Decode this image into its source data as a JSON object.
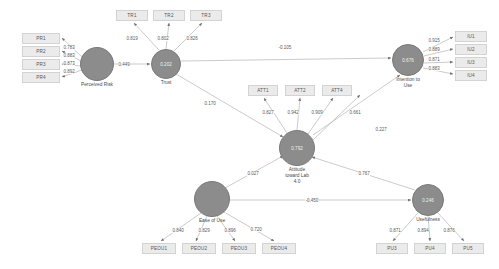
{
  "diagram": {
    "node_fill": "#8c8c8c",
    "indicator_fill": "#ebebeb",
    "edge_color": "#b0b0b0"
  },
  "constructs": [
    {
      "id": "pr",
      "label": "Perceived Risk",
      "value": "",
      "cx": 97,
      "cy": 64,
      "r": 17
    },
    {
      "id": "tr",
      "label": "Trust",
      "value": "0.202",
      "cx": 166,
      "cy": 64,
      "r": 15
    },
    {
      "id": "att",
      "label": "Attitude\ntoward Lab\n4.0",
      "value": "0.792",
      "cx": 297,
      "cy": 148,
      "r": 18
    },
    {
      "id": "iu",
      "label": "Intention to\nUse",
      "value": "0.676",
      "cx": 408,
      "cy": 60,
      "r": 16
    },
    {
      "id": "eou",
      "label": "Ease of Use",
      "value": "",
      "cx": 212,
      "cy": 199,
      "r": 18
    },
    {
      "id": "pu",
      "label": "Usefulness",
      "value": "0.246",
      "cx": 428,
      "cy": 200,
      "r": 16
    }
  ],
  "indicators": [
    {
      "id": "PR1",
      "label": "PR1",
      "x": 22,
      "y": 33,
      "w": 38,
      "h": 11
    },
    {
      "id": "PR2",
      "label": "PR2",
      "x": 22,
      "y": 46,
      "w": 38,
      "h": 11
    },
    {
      "id": "PR3",
      "label": "PR3",
      "x": 22,
      "y": 59,
      "w": 38,
      "h": 11
    },
    {
      "id": "PR4",
      "label": "PR4",
      "x": 22,
      "y": 72,
      "w": 38,
      "h": 11
    },
    {
      "id": "TR1",
      "label": "TR1",
      "x": 116,
      "y": 10,
      "w": 32,
      "h": 11
    },
    {
      "id": "TR2",
      "label": "TR2",
      "x": 153,
      "y": 10,
      "w": 32,
      "h": 11
    },
    {
      "id": "TR3",
      "label": "TR3",
      "x": 190,
      "y": 10,
      "w": 32,
      "h": 11
    },
    {
      "id": "ATT1",
      "label": "ATT1",
      "x": 248,
      "y": 85,
      "w": 30,
      "h": 11
    },
    {
      "id": "ATT2",
      "label": "ATT2",
      "x": 285,
      "y": 85,
      "w": 30,
      "h": 11
    },
    {
      "id": "ATT4",
      "label": "ATT4",
      "x": 322,
      "y": 85,
      "w": 30,
      "h": 11
    },
    {
      "id": "IU1",
      "label": "IU1",
      "x": 455,
      "y": 31,
      "w": 32,
      "h": 11
    },
    {
      "id": "IU2",
      "label": "IU2",
      "x": 455,
      "y": 44,
      "w": 32,
      "h": 11
    },
    {
      "id": "IU3",
      "label": "IU3",
      "x": 455,
      "y": 57,
      "w": 32,
      "h": 11
    },
    {
      "id": "IU4",
      "label": "IU4",
      "x": 455,
      "y": 70,
      "w": 32,
      "h": 11
    },
    {
      "id": "PEOU1",
      "label": "PEOU1",
      "x": 142,
      "y": 243,
      "w": 34,
      "h": 11
    },
    {
      "id": "PEOU2",
      "label": "PEOU2",
      "x": 182,
      "y": 243,
      "w": 34,
      "h": 11
    },
    {
      "id": "PEOU3",
      "label": "PEOU3",
      "x": 222,
      "y": 243,
      "w": 34,
      "h": 11
    },
    {
      "id": "PEOU4",
      "label": "PEOU4",
      "x": 262,
      "y": 243,
      "w": 34,
      "h": 11
    },
    {
      "id": "PU3",
      "label": "PU3",
      "x": 376,
      "y": 243,
      "w": 32,
      "h": 11
    },
    {
      "id": "PU4",
      "label": "PU4",
      "x": 414,
      "y": 243,
      "w": 32,
      "h": 11
    },
    {
      "id": "PU5",
      "label": "PU5",
      "x": 452,
      "y": 243,
      "w": 32,
      "h": 11
    }
  ],
  "loadings": [
    {
      "from": "pr",
      "to": "PR1",
      "value": "0.783",
      "lx": 63,
      "ly": 45
    },
    {
      "from": "pr",
      "to": "PR2",
      "value": "0.883",
      "lx": 63,
      "ly": 53
    },
    {
      "from": "pr",
      "to": "PR3",
      "value": "0.873",
      "lx": 63,
      "ly": 61
    },
    {
      "from": "pr",
      "to": "PR4",
      "value": "0.892",
      "lx": 63,
      "ly": 69
    },
    {
      "from": "tr",
      "to": "TR1",
      "value": "0.819",
      "lx": 126,
      "ly": 36
    },
    {
      "from": "tr",
      "to": "TR2",
      "value": "0.802",
      "lx": 157,
      "ly": 36
    },
    {
      "from": "tr",
      "to": "TR3",
      "value": "0.826",
      "lx": 186,
      "ly": 36
    },
    {
      "from": "att",
      "to": "ATT1",
      "value": "0.827",
      "lx": 262,
      "ly": 110
    },
    {
      "from": "att",
      "to": "ATT2",
      "value": "0.942",
      "lx": 287,
      "ly": 110
    },
    {
      "from": "att",
      "to": "ATT4",
      "value": "0.909",
      "lx": 311,
      "ly": 110
    },
    {
      "from": "att",
      "to": "ATT5",
      "value": "0.661",
      "lx": 349,
      "ly": 110
    },
    {
      "from": "iu",
      "to": "IU1",
      "value": "0.915",
      "lx": 428,
      "ly": 38
    },
    {
      "from": "iu",
      "to": "IU2",
      "value": "0.889",
      "lx": 428,
      "ly": 47
    },
    {
      "from": "iu",
      "to": "IU3",
      "value": "0.871",
      "lx": 428,
      "ly": 57
    },
    {
      "from": "iu",
      "to": "IU4",
      "value": "0.883",
      "lx": 428,
      "ly": 66
    },
    {
      "from": "eou",
      "to": "PEOU1",
      "value": "0.840",
      "lx": 172,
      "ly": 228
    },
    {
      "from": "eou",
      "to": "PEOU2",
      "value": "0.829",
      "lx": 198,
      "ly": 228
    },
    {
      "from": "eou",
      "to": "PEOU3",
      "value": "0.896",
      "lx": 224,
      "ly": 228
    },
    {
      "from": "eou",
      "to": "PEOU4",
      "value": "0.720",
      "lx": 250,
      "ly": 227
    },
    {
      "from": "pu",
      "to": "PU3",
      "value": "0.871",
      "lx": 389,
      "ly": 228
    },
    {
      "from": "pu",
      "to": "PU4",
      "value": "0.894",
      "lx": 417,
      "ly": 228
    },
    {
      "from": "pu",
      "to": "PU5",
      "value": "0.876",
      "lx": 443,
      "ly": 228
    }
  ],
  "paths": [
    {
      "id": "pr-tr",
      "from": "pr",
      "to": "tr",
      "value": "0.449",
      "lx": 118,
      "ly": 62
    },
    {
      "id": "tr-iu",
      "from": "tr",
      "to": "iu",
      "value": "-0.105",
      "lx": 278,
      "ly": 45
    },
    {
      "id": "tr-att",
      "from": "tr",
      "to": "att",
      "value": "0.170",
      "lx": 204,
      "ly": 101
    },
    {
      "id": "att-iu",
      "from": "att",
      "to": "iu",
      "value": "0.227",
      "lx": 375,
      "ly": 127
    },
    {
      "id": "eou-att",
      "from": "eou",
      "to": "att",
      "value": "0.027",
      "lx": 247,
      "ly": 171
    },
    {
      "id": "eou-pu",
      "from": "eou",
      "to": "pu",
      "value": "-0.450",
      "lx": 305,
      "ly": 198
    },
    {
      "id": "pu-att",
      "from": "pu",
      "to": "att",
      "value": "0.767",
      "lx": 358,
      "ly": 171
    }
  ]
}
